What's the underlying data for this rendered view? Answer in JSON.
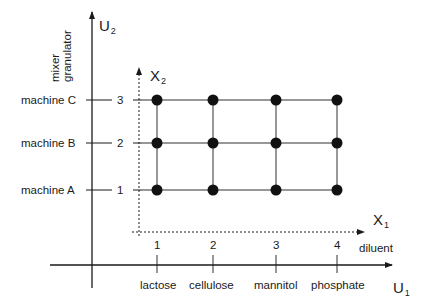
{
  "diagram": {
    "title": "",
    "axes": {
      "U1": {
        "label": "U",
        "subscript": "1",
        "category_title": "diluent",
        "categories": [
          "lactose",
          "cellulose",
          "mannitol",
          "phosphate"
        ]
      },
      "U2": {
        "label": "U",
        "subscript": "2",
        "category_title": [
          "mixer",
          "granulator"
        ],
        "categories": [
          "machine A",
          "machine B",
          "machine C"
        ]
      },
      "X1": {
        "label": "X",
        "subscript": "1",
        "ticks": [
          "1",
          "2",
          "3",
          "4"
        ]
      },
      "X2": {
        "label": "X",
        "subscript": "2",
        "ticks": [
          "1",
          "2",
          "3"
        ]
      }
    },
    "grid_points": [
      [
        1,
        1
      ],
      [
        2,
        1
      ],
      [
        3,
        1
      ],
      [
        4,
        1
      ],
      [
        1,
        2
      ],
      [
        2,
        2
      ],
      [
        3,
        2
      ],
      [
        4,
        2
      ],
      [
        1,
        3
      ],
      [
        2,
        3
      ],
      [
        3,
        3
      ],
      [
        4,
        3
      ]
    ],
    "colors": {
      "ink": "#1a1a1a",
      "background": "#ffffff"
    }
  }
}
